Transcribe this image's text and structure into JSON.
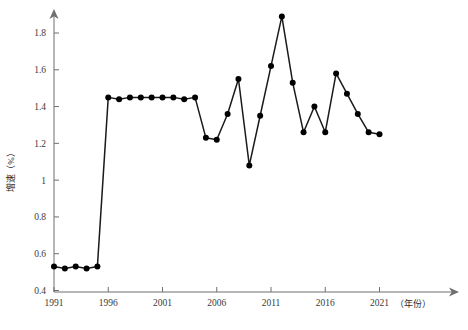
{
  "chart_data": {
    "type": "line",
    "title": "",
    "xlabel": "（年份）",
    "ylabel": "增速（%）",
    "xlim": [
      1991,
      2023
    ],
    "ylim": [
      0.4,
      1.92
    ],
    "xticks": [
      1991,
      1996,
      2001,
      2006,
      2011,
      2016,
      2021
    ],
    "xticklabels": [
      "1991",
      "1996",
      "2001",
      "2006",
      "2011",
      "2016",
      "2021"
    ],
    "yticks": [
      0.4,
      0.6,
      0.8,
      1.0,
      1.2,
      1.4,
      1.6,
      1.8
    ],
    "yticklabels": [
      "0.4",
      "0.6",
      "0.8",
      "1",
      "1.2",
      "1.4",
      "1.6",
      "1.8"
    ],
    "grid": false,
    "legend": null,
    "marker": "filled-circle",
    "line_color": "#1a1a1a",
    "marker_color": "#000000",
    "x": [
      1991,
      1992,
      1993,
      1994,
      1995,
      1996,
      1997,
      1998,
      1999,
      2000,
      2001,
      2002,
      2003,
      2004,
      2005,
      2006,
      2007,
      2008,
      2009,
      2010,
      2011,
      2012,
      2013,
      2014,
      2015,
      2016,
      2017,
      2018,
      2019,
      2020,
      2021
    ],
    "values": [
      0.53,
      0.52,
      0.53,
      0.52,
      0.53,
      1.45,
      1.44,
      1.45,
      1.45,
      1.45,
      1.45,
      1.45,
      1.44,
      1.45,
      1.23,
      1.22,
      1.36,
      1.55,
      1.08,
      1.35,
      1.62,
      1.89,
      1.53,
      1.26,
      1.4,
      1.26,
      1.58,
      1.47,
      1.36,
      1.26,
      1.25
    ],
    "xtick_count": 7,
    "series_name": "增速"
  },
  "figure": {
    "caption": "",
    "y_axis_title": "增速（%）",
    "x_axis_title": "（年份）",
    "axis_arrow": true
  }
}
